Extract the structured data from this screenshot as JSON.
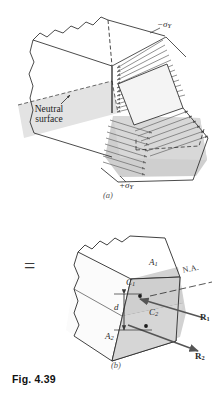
{
  "figure": {
    "caption": "Fig. 4.39",
    "panels": [
      {
        "id": "a",
        "paren_label": "(a)",
        "annotations": {
          "neutral_line1": "Neutral",
          "neutral_line2": "surface",
          "stress_top": "−σ",
          "stress_top_sub": "Y",
          "stress_bottom": "+σ",
          "stress_bottom_sub": "Y"
        }
      },
      {
        "id": "b",
        "paren_label": "(b)",
        "equals_sign": "=",
        "annotations": {
          "area_top": "A",
          "area_top_sub": "1",
          "area_bottom": "A",
          "area_bottom_sub": "2",
          "centroid_top": "C",
          "centroid_top_sub": "1",
          "centroid_bottom": "C",
          "centroid_bottom_sub": "2",
          "distance": "d",
          "neutral_axis": "N.A.",
          "force_top": "R",
          "force_top_sub": "1",
          "force_bottom": "R",
          "force_bottom_sub": "2"
        }
      }
    ],
    "colors": {
      "line": "#2b2b2b",
      "shade_light": "#e2e2e2",
      "shade_mid": "#d2d2d2",
      "shade_dark": "#c2c2c2",
      "arrow": "#6e6e6e",
      "background": "#ffffff"
    }
  }
}
